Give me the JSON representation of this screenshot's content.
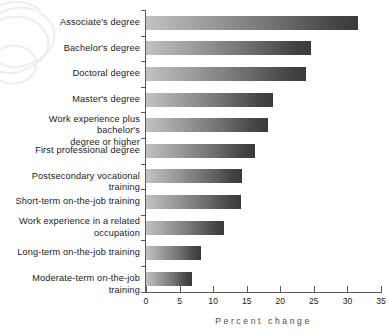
{
  "chart_data": {
    "type": "bar",
    "orientation": "horizontal",
    "title": "",
    "xlabel": "Percent change",
    "ylabel": "",
    "xlim": [
      0,
      35
    ],
    "xticks": [
      0,
      5,
      10,
      15,
      20,
      25,
      30,
      35
    ],
    "grid": false,
    "legend": null,
    "categories": [
      "Associate's degree",
      "Bachelor's degree",
      "Doctoral degree",
      "Master's degree",
      "Work experience plus bachelor's\ndegree or higher",
      "First professional degree",
      "Postsecondary vocational training",
      "Short-term on-the-job training",
      "Work experience in a related\noccupation",
      "Long-term on-the-job training",
      "Moderate-term on-the-job training"
    ],
    "values": [
      31.6,
      24.5,
      23.8,
      18.9,
      18.1,
      16.3,
      14.3,
      14.1,
      11.6,
      8.2,
      6.8
    ],
    "bar_gradient_start": "#c2c2c2",
    "bar_gradient_end": "#3a3a3a",
    "axis_color": "#595959",
    "text_color": "#1b1b1b",
    "watermark_color": "#efefef"
  },
  "axis": {
    "title": "Percent change",
    "ticks": [
      "0",
      "5",
      "10",
      "15",
      "20",
      "25",
      "30",
      "35"
    ]
  }
}
